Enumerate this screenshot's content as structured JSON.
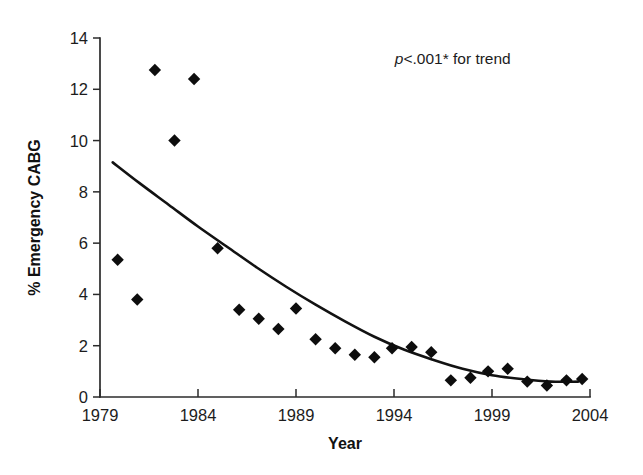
{
  "chart_data": {
    "type": "scatter",
    "title": "",
    "xlabel": "Year",
    "ylabel": "% Emergency CABG",
    "xlim": [
      1979,
      2004
    ],
    "ylim": [
      0,
      14
    ],
    "xticks": [
      1979,
      1984,
      1989,
      1994,
      1999,
      2004
    ],
    "xtick_labels": [
      "1979",
      "1984",
      "1989",
      "1994",
      "1999",
      "2004"
    ],
    "yticks": [
      0,
      2,
      4,
      6,
      8,
      10,
      12,
      14
    ],
    "ytick_labels": [
      "0",
      "2",
      "4",
      "6",
      "8",
      "10",
      "12",
      "14"
    ],
    "grid": false,
    "legend": false,
    "annotations": [
      {
        "name": "p-value-annotation",
        "text_italic": "p",
        "text_plain": "<.001* for trend",
        "full_text": "p<.001* for trend",
        "x": 1997.0,
        "y": 13.0
      }
    ],
    "series": [
      {
        "name": "Observed % Emergency CABG",
        "type": "scatter",
        "marker": "diamond",
        "color": "#0d0d0d",
        "points": [
          {
            "x": 1979.9,
            "y": 5.35
          },
          {
            "x": 1980.9,
            "y": 3.8
          },
          {
            "x": 1981.8,
            "y": 12.75
          },
          {
            "x": 1982.8,
            "y": 10.0
          },
          {
            "x": 1983.8,
            "y": 12.4
          },
          {
            "x": 1985.0,
            "y": 5.8
          },
          {
            "x": 1986.1,
            "y": 3.4
          },
          {
            "x": 1987.1,
            "y": 3.05
          },
          {
            "x": 1988.1,
            "y": 2.65
          },
          {
            "x": 1989.0,
            "y": 3.45
          },
          {
            "x": 1990.0,
            "y": 2.25
          },
          {
            "x": 1991.0,
            "y": 1.9
          },
          {
            "x": 1992.0,
            "y": 1.65
          },
          {
            "x": 1993.0,
            "y": 1.55
          },
          {
            "x": 1993.9,
            "y": 1.9
          },
          {
            "x": 1994.9,
            "y": 1.95
          },
          {
            "x": 1995.9,
            "y": 1.75
          },
          {
            "x": 1996.9,
            "y": 0.65
          },
          {
            "x": 1997.9,
            "y": 0.75
          },
          {
            "x": 1998.8,
            "y": 1.0
          },
          {
            "x": 1999.8,
            "y": 1.1
          },
          {
            "x": 2000.8,
            "y": 0.6
          },
          {
            "x": 2001.8,
            "y": 0.45
          },
          {
            "x": 2002.8,
            "y": 0.65
          },
          {
            "x": 2003.6,
            "y": 0.7
          }
        ]
      },
      {
        "name": "Fitted trend curve",
        "type": "line",
        "color": "#121212",
        "points": [
          {
            "x": 1979.65,
            "y": 9.15
          },
          {
            "x": 1981.0,
            "y": 8.35
          },
          {
            "x": 1982.5,
            "y": 7.5
          },
          {
            "x": 1984.0,
            "y": 6.65
          },
          {
            "x": 1985.5,
            "y": 5.85
          },
          {
            "x": 1987.0,
            "y": 5.05
          },
          {
            "x": 1988.5,
            "y": 4.3
          },
          {
            "x": 1990.0,
            "y": 3.6
          },
          {
            "x": 1991.5,
            "y": 2.95
          },
          {
            "x": 1993.0,
            "y": 2.35
          },
          {
            "x": 1994.5,
            "y": 1.85
          },
          {
            "x": 1996.0,
            "y": 1.45
          },
          {
            "x": 1997.5,
            "y": 1.1
          },
          {
            "x": 1999.0,
            "y": 0.85
          },
          {
            "x": 2000.5,
            "y": 0.7
          },
          {
            "x": 2002.0,
            "y": 0.6
          },
          {
            "x": 2003.4,
            "y": 0.6
          }
        ]
      }
    ]
  }
}
